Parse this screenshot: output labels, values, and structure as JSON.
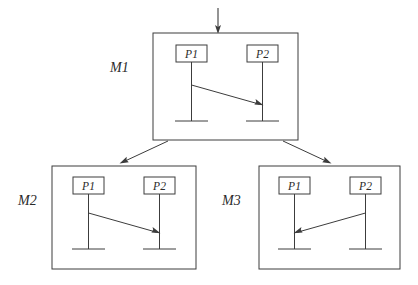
{
  "diagram": {
    "type": "message-sequence-chart-hierarchy",
    "colors": {
      "background": "#ffffff",
      "stroke": "#3c3c3c",
      "text": "#2a2a2a"
    },
    "frames": [
      {
        "id": "m1",
        "label": "M1",
        "label_x": 110,
        "label_y": 72,
        "box": {
          "x": 153,
          "y": 33,
          "w": 145,
          "h": 107
        },
        "instances": [
          {
            "id": "m1-p1",
            "label": "P1",
            "box": {
              "x": 176,
              "y": 45,
              "w": 31,
              "h": 17
            },
            "lifeline_x": 191.5,
            "lifeline_y1": 62,
            "lifeline_y2": 121,
            "ground_x1": 175,
            "ground_x2": 208,
            "ground_y": 121
          },
          {
            "id": "m1-p2",
            "label": "P2",
            "box": {
              "x": 247,
              "y": 45,
              "w": 31,
              "h": 17
            },
            "lifeline_x": 262.5,
            "lifeline_y1": 62,
            "lifeline_y2": 121,
            "ground_x1": 246,
            "ground_x2": 279,
            "ground_y": 121
          }
        ],
        "messages": [
          {
            "id": "m1-msg1",
            "from": "m1-p1",
            "to": "m1-p2",
            "direction": "left-to-right",
            "x1": 191.5,
            "y1": 85,
            "x2": 262.5,
            "y2": 105
          }
        ]
      },
      {
        "id": "m2",
        "label": "M2",
        "label_x": 18,
        "label_y": 205,
        "box": {
          "x": 52,
          "y": 166,
          "w": 144,
          "h": 103
        },
        "instances": [
          {
            "id": "m2-p1",
            "label": "P1",
            "box": {
              "x": 73,
              "y": 177,
              "w": 31,
              "h": 17
            },
            "lifeline_x": 88.5,
            "lifeline_y1": 194,
            "lifeline_y2": 249,
            "ground_x1": 72,
            "ground_x2": 105,
            "ground_y": 249
          },
          {
            "id": "m2-p2",
            "label": "P2",
            "box": {
              "x": 144,
              "y": 177,
              "w": 31,
              "h": 17
            },
            "lifeline_x": 159.5,
            "lifeline_y1": 194,
            "lifeline_y2": 249,
            "ground_x1": 143,
            "ground_x2": 176,
            "ground_y": 249
          }
        ],
        "messages": [
          {
            "id": "m2-msg1",
            "from": "m2-p1",
            "to": "m2-p2",
            "direction": "left-to-right",
            "x1": 88.5,
            "y1": 213,
            "x2": 159.5,
            "y2": 233
          }
        ]
      },
      {
        "id": "m3",
        "label": "M3",
        "label_x": 222,
        "label_y": 205,
        "box": {
          "x": 259,
          "y": 166,
          "w": 141,
          "h": 103
        },
        "instances": [
          {
            "id": "m3-p1",
            "label": "P1",
            "box": {
              "x": 279,
              "y": 177,
              "w": 31,
              "h": 17
            },
            "lifeline_x": 294.5,
            "lifeline_y1": 194,
            "lifeline_y2": 249,
            "ground_x1": 278,
            "ground_x2": 311,
            "ground_y": 249
          },
          {
            "id": "m3-p2",
            "label": "P2",
            "box": {
              "x": 350,
              "y": 177,
              "w": 31,
              "h": 17
            },
            "lifeline_x": 365.5,
            "lifeline_y1": 194,
            "lifeline_y2": 249,
            "ground_x1": 349,
            "ground_x2": 382,
            "ground_y": 249
          }
        ],
        "messages": [
          {
            "id": "m3-msg1",
            "from": "m3-p2",
            "to": "m3-p1",
            "direction": "right-to-left",
            "x1": 365.5,
            "y1": 213,
            "x2": 294.5,
            "y2": 233
          }
        ]
      }
    ],
    "input_arrow": {
      "id": "input-arrow",
      "x1": 218,
      "y1": 8,
      "x2": 218,
      "y2": 33
    },
    "refinement_arrows": [
      {
        "id": "m1-to-m2",
        "from": "m1",
        "to": "m2",
        "x1": 168,
        "y1": 141,
        "x2": 120,
        "y2": 163
      },
      {
        "id": "m1-to-m3",
        "from": "m1",
        "to": "m3",
        "x1": 283,
        "y1": 141,
        "x2": 331,
        "y2": 163
      }
    ]
  }
}
